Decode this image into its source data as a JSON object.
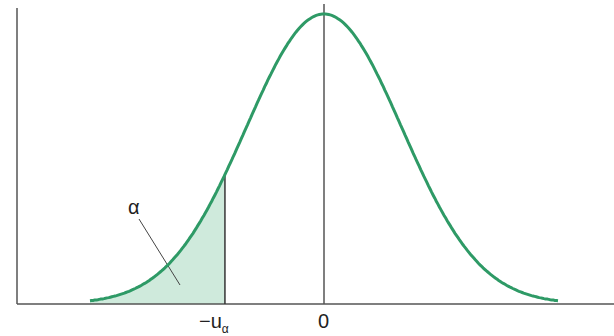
{
  "chart_data": {
    "type": "area",
    "title": "",
    "xlabel": "",
    "ylabel": "",
    "tick_labels": [
      "−u",
      "0"
    ],
    "tick_subscript": "α",
    "annotation": "α",
    "shaded_region": {
      "from": "-inf",
      "to": "-u_alpha"
    },
    "series": [
      {
        "name": "normal density",
        "mean": 0,
        "sd": 1,
        "x_range": [
          -3,
          3
        ]
      }
    ],
    "critical_value_z": -1.27,
    "grid": false,
    "legend": "none",
    "colors": {
      "curve": "#2e9a66",
      "fill": "#c8e8d8",
      "axis": "#444444"
    }
  }
}
